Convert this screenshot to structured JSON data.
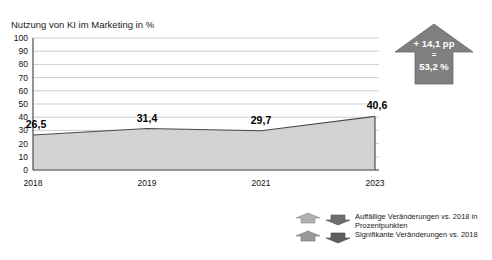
{
  "page": {
    "cropped_headline": "",
    "background": "#ffffff"
  },
  "chart": {
    "axis_title": "Nutzung von KI im Marketing in %",
    "area_fill": "#d2d2d2",
    "line_color": "#4a4a4a",
    "grid_color": "#b8b8b8",
    "axis_color": "#4d4d4d"
  },
  "callout": {
    "line1": "+ 14,1 pp",
    "line2": "=",
    "line3": "53,2 %",
    "color": "#7f7f7f",
    "text_color": "#ffffff",
    "icon": "up-arrow-callout"
  },
  "legend": {
    "items": [
      {
        "icon_up": "arrow-up-light-icon",
        "icon_down": "arrow-down-dark-icon",
        "line1": "Auffällige Veränderungen vs. 2018 in",
        "line2": "Prozentpunkten"
      },
      {
        "icon_up": "arrow-up-light-icon",
        "icon_down": "arrow-down-dark-icon",
        "line1": "Signifikante Veränderungen vs. 2018",
        "line2": ""
      }
    ]
  },
  "chart_data": {
    "type": "area",
    "title": "Nutzung von KI im Marketing in %",
    "xlabel": "",
    "ylabel": "",
    "categories": [
      "2018",
      "2019",
      "2021",
      "2023"
    ],
    "values": [
      26.5,
      31.4,
      29.7,
      40.6
    ],
    "data_labels": [
      "26,5",
      "31,4",
      "29,7",
      "40,6"
    ],
    "ylim": [
      0,
      100
    ],
    "yticks": [
      0,
      10,
      20,
      30,
      40,
      50,
      60,
      70,
      80,
      90,
      100
    ],
    "ytick_labels": [
      "0",
      "10",
      "20",
      "30",
      "40",
      "50",
      "60",
      "70",
      "80",
      "90",
      "100"
    ],
    "grid": "horizontal",
    "legend_position": "bottom-right",
    "annotations": [
      {
        "text": "+ 14,1 pp = 53,2 %",
        "kind": "up-arrow-callout"
      }
    ]
  }
}
